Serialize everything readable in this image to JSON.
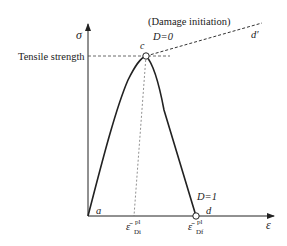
{
  "diagram": {
    "title_annotation": "(Damage initiation)",
    "axes": {
      "y_label": "σ",
      "x_label": "ε"
    },
    "labels": {
      "tensile_strength": "Tensile strength",
      "point_a": "a",
      "point_c": "c",
      "point_d": "d",
      "point_d_prime": "d′",
      "damage_zero": "D=0",
      "damage_one": "D=1",
      "eps_di_main": "ε̄",
      "eps_di_sup": "pl",
      "eps_di_sub": "Di",
      "eps_df_main": "ε̄",
      "eps_df_sup": "pl",
      "eps_df_sub": "Df"
    },
    "colors": {
      "line": "#222222",
      "dashed": "#444444",
      "background": "#ffffff"
    }
  }
}
